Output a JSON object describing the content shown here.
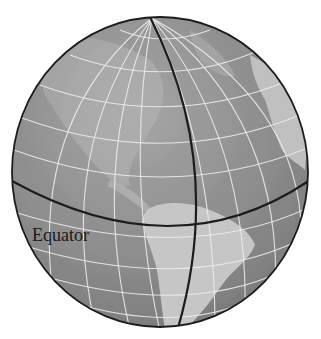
{
  "diagram": {
    "labels": {
      "equator": "Equator"
    },
    "colors": {
      "background": "#ffffff",
      "ocean": "#8a8a8a",
      "land": "#c2c2c2",
      "grid": "#e8e8e8",
      "outline": "#1c1c1c",
      "equator_line": "#1c1c1c",
      "meridian_line": "#1c1c1c"
    },
    "elements": [
      {
        "name": "globe",
        "type": "sphere"
      },
      {
        "name": "graticule",
        "type": "latitude-longitude-grid"
      },
      {
        "name": "equator-line",
        "type": "great-circle"
      },
      {
        "name": "prime-meridian-line",
        "type": "great-circle"
      },
      {
        "name": "americas-landmass",
        "type": "land"
      },
      {
        "name": "africa-europe-landmass",
        "type": "land"
      }
    ]
  }
}
